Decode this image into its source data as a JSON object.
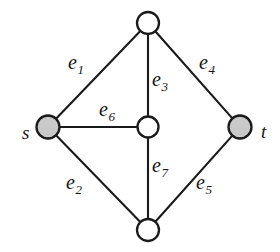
{
  "figure": {
    "type": "undirected-graph",
    "width": 280,
    "height": 252,
    "background_color": "#ffffff",
    "stroke_color": "#1a1a1a",
    "terminal_fill_color": "#c9c9c9",
    "plain_fill_color": "#ffffff"
  },
  "nodes": [
    {
      "id": "top",
      "label": "",
      "x": 148,
      "y": 23,
      "r": 11,
      "fill": "#ffffff",
      "terminal": false
    },
    {
      "id": "s",
      "label": "s",
      "x": 48,
      "y": 127,
      "r": 11.5,
      "fill": "#c9c9c9",
      "terminal": true
    },
    {
      "id": "center",
      "label": "",
      "x": 148,
      "y": 127,
      "r": 10.5,
      "fill": "#ffffff",
      "terminal": false
    },
    {
      "id": "t",
      "label": "t",
      "x": 240,
      "y": 127,
      "r": 11.5,
      "fill": "#c9c9c9",
      "terminal": true
    },
    {
      "id": "bottom",
      "label": "",
      "x": 148,
      "y": 230,
      "r": 11,
      "fill": "#ffffff",
      "terminal": false
    }
  ],
  "node_labels": [
    {
      "id": "s",
      "text": "s",
      "x": 22,
      "y": 123
    },
    {
      "id": "t",
      "text": "t",
      "x": 261,
      "y": 122
    }
  ],
  "edges": [
    {
      "id": "e1",
      "label": "e",
      "subscript": "1",
      "from": "s",
      "to": "top",
      "label_x": 68,
      "label_y": 52
    },
    {
      "id": "e2",
      "label": "e",
      "subscript": "2",
      "from": "s",
      "to": "bottom",
      "label_x": 66,
      "label_y": 172
    },
    {
      "id": "e3",
      "label": "e",
      "subscript": "3",
      "from": "top",
      "to": "center",
      "label_x": 152,
      "label_y": 69
    },
    {
      "id": "e4",
      "label": "e",
      "subscript": "4",
      "from": "top",
      "to": "t",
      "label_x": 199,
      "label_y": 52
    },
    {
      "id": "e5",
      "label": "e",
      "subscript": "5",
      "from": "bottom",
      "to": "t",
      "label_x": 196,
      "label_y": 172
    },
    {
      "id": "e6",
      "label": "e",
      "subscript": "6",
      "from": "s",
      "to": "center",
      "label_x": 99,
      "label_y": 99
    },
    {
      "id": "e7",
      "label": "e",
      "subscript": "7",
      "from": "center",
      "to": "bottom",
      "label_x": 152,
      "label_y": 155
    }
  ]
}
